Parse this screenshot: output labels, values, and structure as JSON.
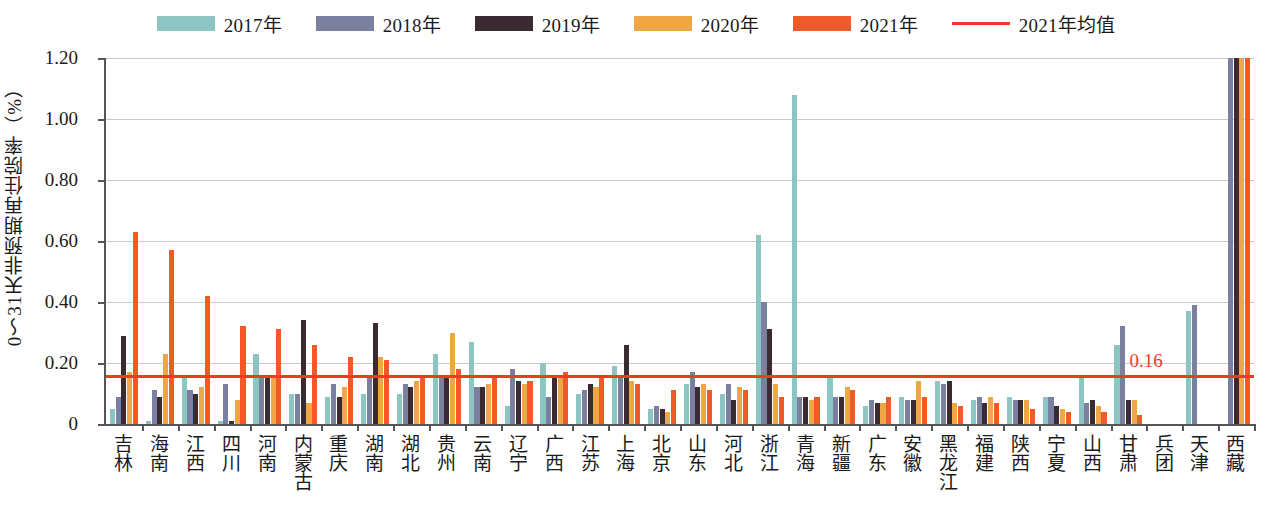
{
  "legend": {
    "items": [
      {
        "label": "2017年",
        "color": "#8cc5c2",
        "kind": "swatch",
        "icon": "legend-swatch-2017"
      },
      {
        "label": "2018年",
        "color": "#7b80a0",
        "kind": "swatch",
        "icon": "legend-swatch-2018"
      },
      {
        "label": "2019年",
        "color": "#3a2b33",
        "kind": "swatch",
        "icon": "legend-swatch-2019"
      },
      {
        "label": "2020年",
        "color": "#f0a644",
        "kind": "swatch",
        "icon": "legend-swatch-2020"
      },
      {
        "label": "2021年",
        "color": "#ef5b28",
        "kind": "swatch",
        "icon": "legend-swatch-2021"
      },
      {
        "label": "2021年均值",
        "color": "#ef3b24",
        "kind": "line",
        "icon": "legend-line-mean"
      }
    ]
  },
  "axes": {
    "ylabel": "0～31天非预期再住院率（%）",
    "yticks": [
      "0",
      "0.20",
      "0.40",
      "0.60",
      "0.80",
      "1.00",
      "1.20"
    ],
    "ytick_values": [
      0,
      0.2,
      0.4,
      0.6,
      0.8,
      1.0,
      1.2
    ],
    "ylim": [
      0,
      1.2
    ],
    "xlabel": ""
  },
  "annotations": {
    "mean_label": "0.16",
    "mean_value": 0.16
  },
  "chart_data": {
    "type": "bar",
    "title": "",
    "subtitle": "",
    "xlabel": "",
    "ylabel": "0～31天非预期再住院率（%）",
    "ylim": [
      0,
      1.2
    ],
    "grid": true,
    "legend_position": "top-center",
    "categories": [
      "吉林",
      "海南",
      "江西",
      "四川",
      "河南",
      "内蒙古",
      "重庆",
      "湖南",
      "湖北",
      "贵州",
      "云南",
      "辽宁",
      "广西",
      "江苏",
      "上海",
      "北京",
      "山东",
      "河北",
      "浙江",
      "青海",
      "新疆",
      "广东",
      "安徽",
      "黑龙江",
      "福建",
      "陕西",
      "宁夏",
      "山西",
      "甘肃",
      "兵团",
      "天津",
      "西藏"
    ],
    "series": [
      {
        "name": "2017年",
        "color": "#8cc5c2",
        "values": [
          0.05,
          0.01,
          0.15,
          0.01,
          0.23,
          0.1,
          0.09,
          0.1,
          0.1,
          0.23,
          0.27,
          0.06,
          0.2,
          0.1,
          0.19,
          0.05,
          0.13,
          0.1,
          0.62,
          1.08,
          0.16,
          0.06,
          0.09,
          0.14,
          0.08,
          0.09,
          0.09,
          0.16,
          0.26,
          0.0,
          0.37,
          0.0
        ]
      },
      {
        "name": "2018年",
        "color": "#7b80a0",
        "values": [
          0.09,
          0.11,
          0.11,
          0.13,
          0.15,
          0.1,
          0.13,
          0.15,
          0.13,
          0.16,
          0.12,
          0.18,
          0.09,
          0.11,
          0.16,
          0.06,
          0.17,
          0.13,
          0.4,
          0.09,
          0.09,
          0.08,
          0.08,
          0.13,
          0.09,
          0.08,
          0.09,
          0.07,
          0.32,
          0.0,
          0.39,
          1.2
        ]
      },
      {
        "name": "2019年",
        "color": "#3a2b33",
        "values": [
          0.29,
          0.09,
          0.1,
          0.01,
          0.15,
          0.34,
          0.09,
          0.33,
          0.12,
          0.15,
          0.12,
          0.14,
          0.15,
          0.13,
          0.26,
          0.05,
          0.12,
          0.08,
          0.31,
          0.09,
          0.09,
          0.07,
          0.08,
          0.14,
          0.07,
          0.08,
          0.06,
          0.08,
          0.08,
          0.0,
          0.0,
          1.2
        ]
      },
      {
        "name": "2020年",
        "color": "#f0a644",
        "values": [
          0.17,
          0.23,
          0.12,
          0.08,
          0.15,
          0.07,
          0.12,
          0.22,
          0.14,
          0.3,
          0.13,
          0.13,
          0.15,
          0.12,
          0.14,
          0.04,
          0.13,
          0.12,
          0.13,
          0.08,
          0.12,
          0.07,
          0.14,
          0.07,
          0.09,
          0.08,
          0.05,
          0.06,
          0.08,
          0.0,
          0.0,
          1.2
        ]
      },
      {
        "name": "2021年",
        "color": "#ef5b28",
        "values": [
          0.63,
          0.57,
          0.42,
          0.32,
          0.31,
          0.26,
          0.22,
          0.21,
          0.16,
          0.18,
          0.16,
          0.14,
          0.17,
          0.15,
          0.13,
          0.11,
          0.11,
          0.11,
          0.09,
          0.09,
          0.11,
          0.09,
          0.09,
          0.06,
          0.07,
          0.05,
          0.04,
          0.04,
          0.03,
          0.0,
          0.0,
          1.2
        ]
      }
    ],
    "mean_line": {
      "name": "2021年均值",
      "value": 0.16,
      "color": "#ef3b24",
      "label": "0.16"
    }
  }
}
